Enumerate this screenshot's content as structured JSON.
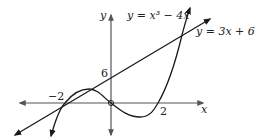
{
  "diagram": {
    "axes": {
      "x_label": "x",
      "y_label": "y"
    },
    "curves": [
      {
        "name": "cubic",
        "label": "y = x³ − 4x"
      },
      {
        "name": "line",
        "label": "y = 3x + 6"
      }
    ],
    "tick_labels": {
      "x_neg": "−2",
      "x_pos": "2",
      "y_intercept": "6"
    },
    "colors": {
      "stroke": "#1a1a1a",
      "axis": "#555555",
      "background": "#ffffff"
    }
  }
}
